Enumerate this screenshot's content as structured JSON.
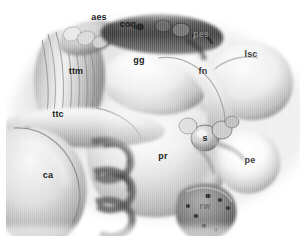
{
  "figure": {
    "style": "grayscale-3d-render",
    "width": 308,
    "height": 245,
    "background_color": "#ffffff",
    "colors": {
      "background": "#ffffff",
      "highlight": "#f4f4f4",
      "midtone": "#b9b9b9",
      "shadow": "#6a6a6a",
      "deep_shadow": "#2e2e2e",
      "label_dark": "#1b1b1b",
      "label_light": "#8a8a8a"
    }
  },
  "labels": [
    {
      "id": "aes",
      "text": "aes",
      "x": 99,
      "y": 17,
      "tone": "dark"
    },
    {
      "id": "coq",
      "text": "coq",
      "x": 128,
      "y": 24,
      "tone": "dark"
    },
    {
      "id": "pes",
      "text": "pes",
      "x": 201,
      "y": 34,
      "tone": "faint"
    },
    {
      "id": "lsc",
      "text": "lsc",
      "x": 251,
      "y": 54,
      "tone": "mid"
    },
    {
      "id": "gg",
      "text": "gg",
      "x": 139,
      "y": 60,
      "tone": "dark"
    },
    {
      "id": "ttm",
      "text": "ttm",
      "x": 76,
      "y": 71,
      "tone": "dark"
    },
    {
      "id": "fn",
      "text": "fn",
      "x": 203,
      "y": 71,
      "tone": "mid"
    },
    {
      "id": "ttc",
      "text": "ttc",
      "x": 58,
      "y": 114,
      "tone": "dark"
    },
    {
      "id": "s",
      "text": "s",
      "x": 205,
      "y": 138,
      "tone": "dark"
    },
    {
      "id": "pr",
      "text": "pr",
      "x": 163,
      "y": 156,
      "tone": "dark"
    },
    {
      "id": "pe",
      "text": "pe",
      "x": 250,
      "y": 160,
      "tone": "mid"
    },
    {
      "id": "ca",
      "text": "ca",
      "x": 48,
      "y": 175,
      "tone": "dark"
    },
    {
      "id": "rw",
      "text": "rw",
      "x": 205,
      "y": 206,
      "tone": "light"
    }
  ]
}
